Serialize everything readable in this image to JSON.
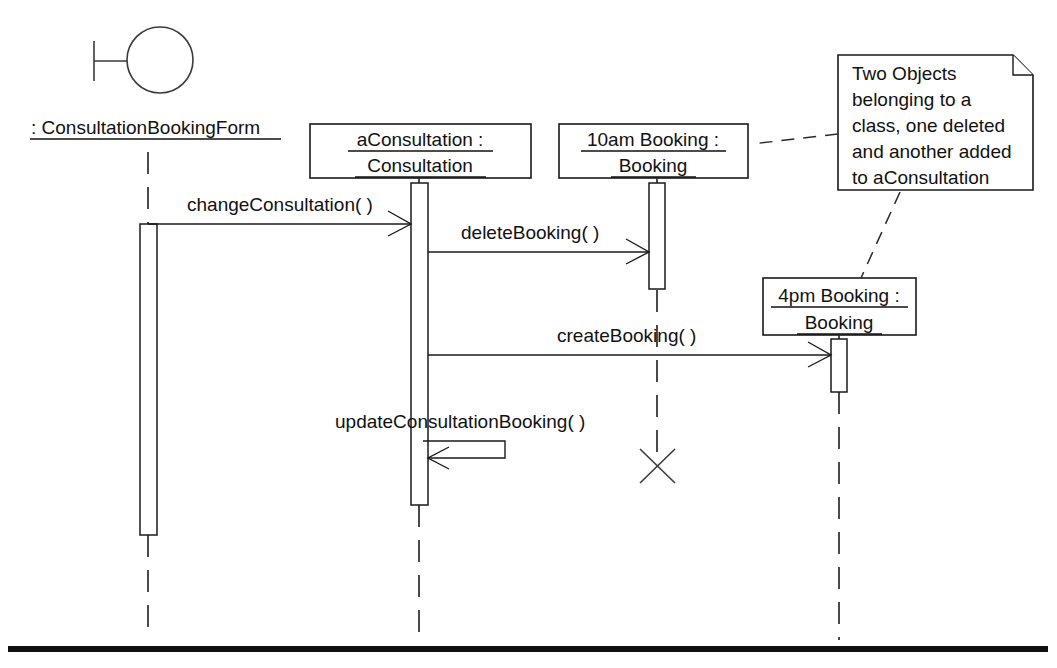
{
  "diagram": {
    "kind": "uml-sequence-diagram",
    "background_color": "#ffffff",
    "line_color": "#1a1a1a",
    "text_color": "#111111"
  },
  "actor": {
    "name": ": ConsultationBookingForm",
    "icon": "boundary-object-icon",
    "label_underlined": true
  },
  "objects": [
    {
      "id": "consultation",
      "line1": "aConsultation :",
      "line2": "Consultation",
      "underlined": true
    },
    {
      "id": "booking10am",
      "line1": "10am Booking :",
      "line2": "Booking",
      "underlined": true,
      "destroyed": true
    },
    {
      "id": "booking4pm",
      "line1": "4pm Booking :",
      "line2": "Booking",
      "underlined": true,
      "destroyed": false
    }
  ],
  "messages": [
    {
      "id": "m1",
      "label": "changeConsultation( )",
      "from": "actor",
      "to": "consultation",
      "kind": "synchronous"
    },
    {
      "id": "m2",
      "label": "deleteBooking( )",
      "from": "consultation",
      "to": "booking10am",
      "kind": "synchronous"
    },
    {
      "id": "m3",
      "label": "createBooking( )",
      "from": "consultation",
      "to": "booking4pm",
      "kind": "synchronous"
    },
    {
      "id": "m4",
      "label": "updateConsultationBooking( )",
      "from": "consultation",
      "to": "consultation",
      "kind": "self-call"
    }
  ],
  "note": {
    "lines": [
      "Two Objects",
      "belonging to a",
      "class, one deleted",
      "and another added",
      "to aConsultation"
    ],
    "anchors": [
      "booking10am",
      "booking4pm"
    ]
  }
}
